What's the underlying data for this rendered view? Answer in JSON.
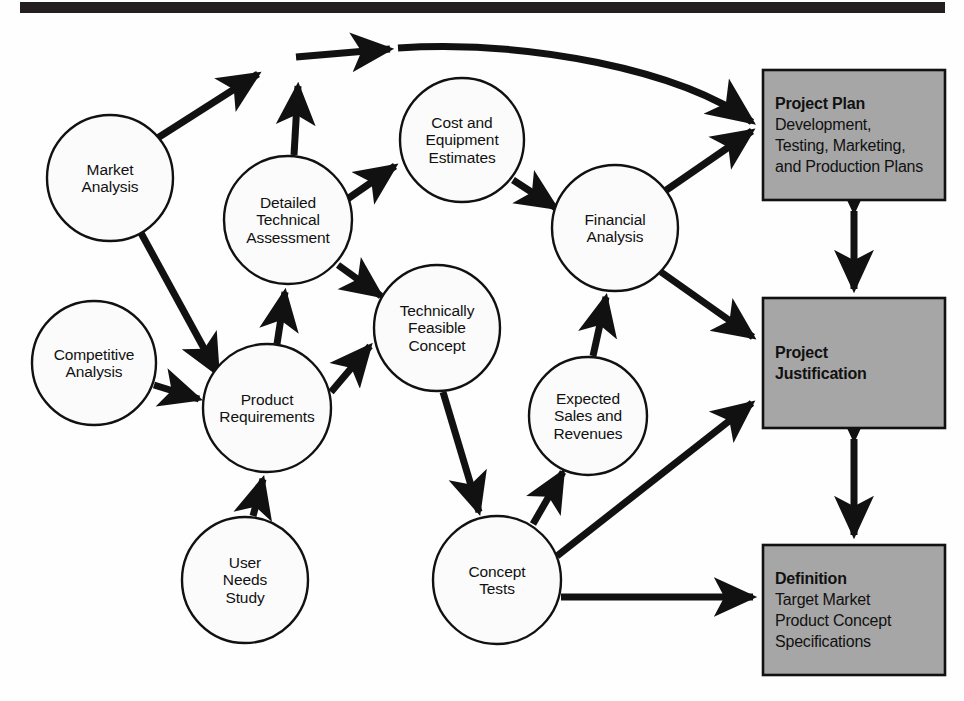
{
  "diagram": {
    "colors": {
      "header_bar": "#231f20",
      "circle_fill": "#fbfbfb",
      "circle_stroke": "#111111",
      "box_fill": "#a6a6a6",
      "box_stroke": "#111111",
      "arrow": "#111111",
      "background": "#ffffff"
    },
    "header_bar": {
      "name": "top-rule",
      "visible": true
    },
    "nodes": [
      {
        "id": "market-analysis",
        "label": "Market\nAnalysis",
        "lines": [
          "Market",
          "Analysis"
        ],
        "shape": "circle",
        "cx": 110,
        "cy": 178,
        "r": 63
      },
      {
        "id": "competitive-analysis",
        "label": "Competitive\nAnalysis",
        "lines": [
          "Competitive",
          "Analysis"
        ],
        "shape": "circle",
        "cx": 94,
        "cy": 363,
        "r": 62
      },
      {
        "id": "product-requirements",
        "label": "Product\nRequirements",
        "lines": [
          "Product",
          "Requirements"
        ],
        "shape": "circle",
        "cx": 267,
        "cy": 408,
        "r": 64
      },
      {
        "id": "user-needs-study",
        "label": "User\nNeeds\nStudy",
        "lines": [
          "User",
          "Needs",
          "Study"
        ],
        "shape": "circle",
        "cx": 245,
        "cy": 580,
        "r": 63
      },
      {
        "id": "detailed-technical-assessment",
        "label": "Detailed\nTechnical\nAssessment",
        "lines": [
          "Detailed",
          "Technical",
          "Assessment"
        ],
        "shape": "circle",
        "cx": 288,
        "cy": 220,
        "r": 64
      },
      {
        "id": "cost-equipment-estimates",
        "label": "Cost and\nEquipment\nEstimates",
        "lines": [
          "Cost and",
          "Equipment",
          "Estimates"
        ],
        "shape": "circle",
        "cx": 462,
        "cy": 140,
        "r": 62
      },
      {
        "id": "technically-feasible-concept",
        "label": "Technically\nFeasible\nConcept",
        "lines": [
          "Technically",
          "Feasible",
          "Concept"
        ],
        "shape": "circle",
        "cx": 437,
        "cy": 328,
        "r": 63
      },
      {
        "id": "financial-analysis",
        "label": "Financial\nAnalysis",
        "lines": [
          "Financial",
          "Analysis"
        ],
        "shape": "circle",
        "cx": 615,
        "cy": 228,
        "r": 63
      },
      {
        "id": "expected-sales-revenues",
        "label": "Expected\nSales and\nRevenues",
        "lines": [
          "Expected",
          "Sales and",
          "Revenues"
        ],
        "shape": "circle",
        "cx": 588,
        "cy": 416,
        "r": 59
      },
      {
        "id": "concept-tests",
        "label": "Concept\nTests",
        "lines": [
          "Concept",
          "Tests"
        ],
        "shape": "circle",
        "cx": 497,
        "cy": 580,
        "r": 64
      }
    ],
    "boxes": [
      {
        "id": "project-plan",
        "title": "Project Plan",
        "body": [
          "Development,",
          "Testing, Marketing,",
          "and Production Plans"
        ],
        "x": 763,
        "y": 70,
        "w": 182,
        "h": 130
      },
      {
        "id": "project-justification",
        "title": "Project\nJustification",
        "title_lines": [
          "Project",
          "Justification"
        ],
        "body": [],
        "x": 763,
        "y": 298,
        "w": 182,
        "h": 130
      },
      {
        "id": "definition",
        "title": "Definition",
        "body": [
          "Target Market",
          "Product Concept",
          "Specifications"
        ],
        "x": 763,
        "y": 545,
        "w": 182,
        "h": 130
      }
    ],
    "edges": [
      {
        "from": "market-analysis",
        "to": "junction-top",
        "type": "arrow"
      },
      {
        "from": "market-analysis",
        "to": "product-requirements",
        "type": "arrow"
      },
      {
        "from": "competitive-analysis",
        "to": "product-requirements",
        "type": "arrow"
      },
      {
        "from": "user-needs-study",
        "to": "product-requirements",
        "type": "arrow"
      },
      {
        "from": "product-requirements",
        "to": "detailed-technical-assessment",
        "type": "arrow"
      },
      {
        "from": "product-requirements",
        "to": "technically-feasible-concept",
        "type": "arrow"
      },
      {
        "from": "detailed-technical-assessment",
        "to": "junction-top",
        "type": "arrow"
      },
      {
        "from": "detailed-technical-assessment",
        "to": "cost-equipment-estimates",
        "type": "arrow"
      },
      {
        "from": "detailed-technical-assessment",
        "to": "technically-feasible-concept",
        "type": "arrow"
      },
      {
        "from": "junction-top",
        "to": "project-plan",
        "type": "curved-arrow"
      },
      {
        "from": "cost-equipment-estimates",
        "to": "financial-analysis",
        "type": "arrow"
      },
      {
        "from": "technically-feasible-concept",
        "to": "concept-tests",
        "type": "arrow"
      },
      {
        "from": "concept-tests",
        "to": "expected-sales-revenues",
        "type": "arrow"
      },
      {
        "from": "expected-sales-revenues",
        "to": "financial-analysis",
        "type": "arrow"
      },
      {
        "from": "financial-analysis",
        "to": "project-plan",
        "type": "double-arrow"
      },
      {
        "from": "financial-analysis",
        "to": "project-justification",
        "type": "arrow"
      },
      {
        "from": "concept-tests",
        "to": "project-justification",
        "type": "arrow"
      },
      {
        "from": "concept-tests",
        "to": "definition",
        "type": "arrow"
      },
      {
        "from": "project-plan",
        "to": "project-justification",
        "type": "double-arrow"
      },
      {
        "from": "project-justification",
        "to": "definition",
        "type": "double-arrow"
      }
    ]
  }
}
